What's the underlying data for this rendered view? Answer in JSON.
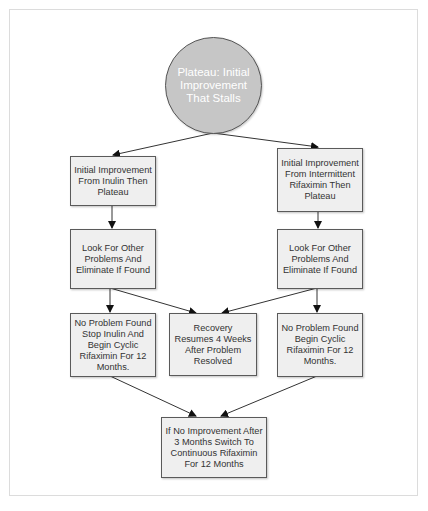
{
  "diagram": {
    "type": "flowchart",
    "colors": {
      "start_fill": "#c6c6c6",
      "box_fill": "#efefef",
      "border": "#5a5a5a",
      "text": "#333333",
      "start_text": "#ffffff"
    },
    "nodes": {
      "start": {
        "label": "Plateau: Initial Improvement That Stalls",
        "shape": "circle"
      },
      "inulin_plateau": {
        "label": "Initial Improvement From Inulin Then Plateau"
      },
      "rifaximin_plateau": {
        "label": "Initial Improvement From Intermittent Rifaximin Then Plateau"
      },
      "look_left": {
        "label": "Look For Other Problems And Eliminate If Found"
      },
      "look_right": {
        "label": "Look For Other Problems And Eliminate If Found"
      },
      "no_problem_inulin": {
        "label": "No Problem Found Stop Inulin And Begin Cyclic Rifaximin For 12 Months."
      },
      "recovery": {
        "label": "Recovery Resumes 4 Weeks After Problem Resolved"
      },
      "no_problem_rifaximin": {
        "label": "No Problem Found  Begin Cyclic Rifaximin For 12 Months."
      },
      "no_improvement": {
        "label": "If No Improvement After 3 Months Switch To Continuous Rifaximin For 12 Months"
      }
    },
    "edges": [
      [
        "start",
        "inulin_plateau"
      ],
      [
        "start",
        "rifaximin_plateau"
      ],
      [
        "inulin_plateau",
        "look_left"
      ],
      [
        "rifaximin_plateau",
        "look_right"
      ],
      [
        "look_left",
        "no_problem_inulin"
      ],
      [
        "look_left",
        "recovery"
      ],
      [
        "look_right",
        "recovery"
      ],
      [
        "look_right",
        "no_problem_rifaximin"
      ],
      [
        "no_problem_inulin",
        "no_improvement"
      ],
      [
        "no_problem_rifaximin",
        "no_improvement"
      ]
    ]
  }
}
